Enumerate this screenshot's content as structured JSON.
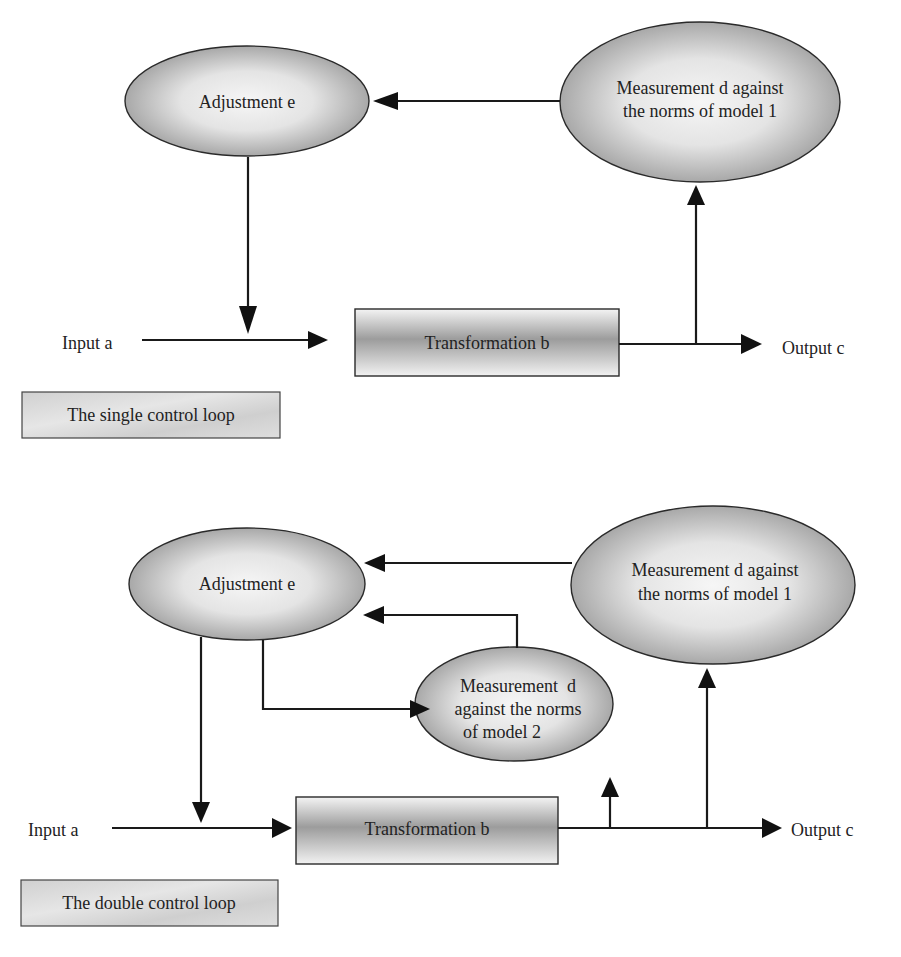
{
  "diagrams": [
    {
      "caption": "The single control loop",
      "nodes": {
        "adjustment": {
          "lines": [
            "Adjustment e"
          ]
        },
        "measurement1": {
          "lines": [
            "Measurement d against",
            "the norms of model 1"
          ]
        },
        "transformation": {
          "lines": [
            "Transformation b"
          ]
        },
        "input": {
          "lines": [
            "Input a"
          ]
        },
        "output": {
          "lines": [
            "Output c"
          ]
        }
      }
    },
    {
      "caption": "The double control loop",
      "nodes": {
        "adjustment": {
          "lines": [
            "Adjustment e"
          ]
        },
        "measurement1": {
          "lines": [
            "Measurement d against",
            "the norms of model 1"
          ]
        },
        "measurement2": {
          "lines": [
            "Measurement  d",
            "against the norms",
            "of model 2"
          ]
        },
        "transformation": {
          "lines": [
            "Transformation b"
          ]
        },
        "input": {
          "lines": [
            "Input a"
          ]
        },
        "output": {
          "lines": [
            "Output c"
          ]
        }
      }
    }
  ],
  "colors": {
    "line": "#1a1a1a",
    "fill_light": "#f2f2f2",
    "fill_dark": "#9a9a9a",
    "caption_fill": "#d4d4d4"
  }
}
